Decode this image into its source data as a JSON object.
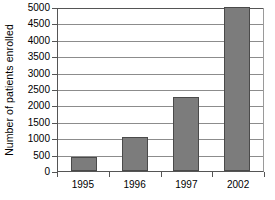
{
  "chart_data": {
    "type": "bar",
    "title": "",
    "xlabel": "",
    "ylabel": "Number of patients enrolled",
    "categories": [
      "1995",
      "1996",
      "1997",
      "2002"
    ],
    "values": [
      420,
      1050,
      2250,
      5000
    ],
    "series": [
      {
        "name": "Patients enrolled",
        "values": [
          420,
          1050,
          2250,
          5000
        ]
      }
    ],
    "ylim": [
      0,
      5000
    ],
    "yticks": [
      0,
      500,
      1000,
      1500,
      2000,
      2500,
      3000,
      3500,
      4000,
      4500,
      5000
    ],
    "ytick_labels": [
      "0",
      "500",
      "1000",
      "1500",
      "2000",
      "2500",
      "3000",
      "3500",
      "4000",
      "4500",
      "5000"
    ],
    "grid": "horizontal",
    "legend": "none",
    "bar_color": "#7c7c7c",
    "bar_border_color": "#4a4a4a",
    "gridline_color": "#8c8c8c",
    "axis_color": "#555555",
    "background_color": "#ffffff"
  }
}
